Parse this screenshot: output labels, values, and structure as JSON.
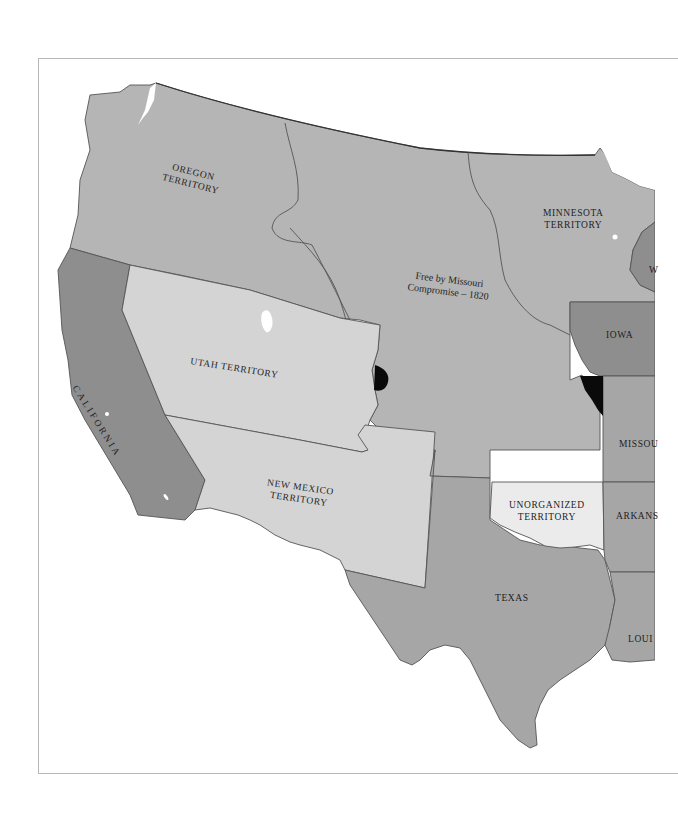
{
  "map": {
    "colors": {
      "background": "#ffffff",
      "frame": "#b8b8b8",
      "free_territory": "#b5b5b5",
      "free_state": "#8e8e8e",
      "slave_state": "#a6a6a6",
      "open_territory": "#d4d4d4",
      "unorganized": "#ebebeb",
      "disputed": "#0a0a0a",
      "border": "#555555"
    },
    "labels": {
      "oregon_line1": "OREGON",
      "oregon_line2": "TERRITORY",
      "minnesota_line1": "MINNESOTA",
      "minnesota_line2": "TERRITORY",
      "missouri_compromise_line1": "Free by Missouri",
      "missouri_compromise_line2": "Compromise – 1820",
      "iowa": "IOWA",
      "utah": "UTAH TERRITORY",
      "california": "CALIFORNIA",
      "missouri": "MISSOU",
      "new_mexico_line1": "NEW MEXICO",
      "new_mexico_line2": "TERRITORY",
      "unorganized_line1": "UNORGANIZED",
      "unorganized_line2": "TERRITORY",
      "arkansas": "ARKANS",
      "texas": "TEXAS",
      "louisiana": "LOUI",
      "wisconsin": "W"
    }
  }
}
